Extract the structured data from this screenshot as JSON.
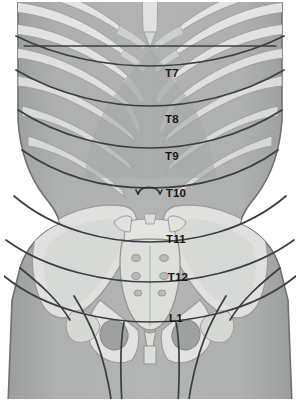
{
  "figure": {
    "type": "anatomical-illustration",
    "view": "anterior",
    "background_color": "#ffffff",
    "canvas": {
      "width": 300,
      "height": 405
    }
  },
  "palette": {
    "skin_base": "#a9acab",
    "skin_shade": "#9a9d9c",
    "skin_light": "#b7bab9",
    "bone_light": "#e4e5e2",
    "bone_mid": "#d2d4d1",
    "bone_dark": "#c0c2bf",
    "bone_shadow": "#b0b2af",
    "outline": "#6e7174",
    "dermatome_line": "#3b3f43",
    "label_text": "#15181b",
    "pelvis_fill": "#dcdedb",
    "foramen_dark": "#8e9190"
  },
  "dermatomes": [
    {
      "id": "T7",
      "label": "T7",
      "x": 172,
      "y": 77,
      "landmark": "just below the xiphoid process"
    },
    {
      "id": "T8",
      "label": "T8",
      "x": 172,
      "y": 123,
      "landmark": "upper epigastric level"
    },
    {
      "id": "T9",
      "label": "T9",
      "x": 172,
      "y": 160,
      "landmark": "mid epigastric level"
    },
    {
      "id": "T10",
      "label": "T10",
      "x": 176,
      "y": 197,
      "landmark": "umbilicus"
    },
    {
      "id": "T11",
      "label": "T11",
      "x": 176,
      "y": 243,
      "landmark": "lower abdomen below umbilicus"
    },
    {
      "id": "T12",
      "label": "T12",
      "x": 178,
      "y": 281,
      "landmark": "above the inguinal ligament"
    },
    {
      "id": "L1",
      "label": "L1",
      "x": 176,
      "y": 322,
      "landmark": "inguinal / groin region"
    }
  ],
  "landmarks": [
    {
      "id": "umbilicus",
      "name": "umbilicus-marker",
      "x": 148,
      "y": 190,
      "shape": "arch"
    },
    {
      "id": "xiphoid",
      "name": "xiphoid-process",
      "x": 150,
      "y": 46
    },
    {
      "id": "costal-margin",
      "name": "costal-margin",
      "description": "inverted V formed by the lower rib cartilages"
    },
    {
      "id": "iliac-crest",
      "name": "iliac-crest",
      "description": "flared upper rim of the pelvis"
    },
    {
      "id": "sacrum",
      "name": "sacrum",
      "description": "central wedge bone with paired foramina"
    },
    {
      "id": "pubic-symphysis",
      "name": "pubic-symphysis",
      "x": 150,
      "y": 352
    }
  ],
  "skeletal_structures": {
    "ribs_per_side": 7,
    "sacral_foramina_rows": 3,
    "sacral_foramina_columns": 2,
    "obturator_foramina": 2
  }
}
